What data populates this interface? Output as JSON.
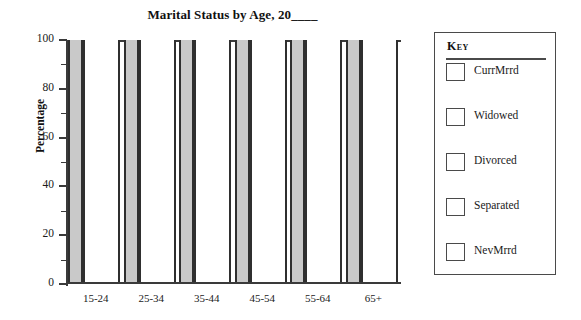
{
  "chart_data": {
    "type": "bar",
    "title": "Marital Status by Age, 20____",
    "xlabel": "",
    "ylabel": "Percentage",
    "categories": [
      "15-24",
      "25-34",
      "35-44",
      "45-54",
      "55-64",
      "65+"
    ],
    "series": [
      {
        "name": "CurrMrrd",
        "values": [
          100,
          100,
          100,
          100,
          100,
          100
        ]
      },
      {
        "name": "Widowed",
        "values": [
          0,
          0,
          0,
          0,
          0,
          0
        ]
      },
      {
        "name": "Divorced",
        "values": [
          0,
          0,
          0,
          0,
          0,
          0
        ]
      },
      {
        "name": "Separated",
        "values": [
          0,
          0,
          0,
          0,
          0,
          0
        ]
      },
      {
        "name": "NevMrrd",
        "values": [
          0,
          0,
          0,
          0,
          0,
          0
        ]
      }
    ],
    "stacked": true,
    "ylim": [
      0,
      100
    ],
    "y_ticks": [
      0,
      20,
      40,
      60,
      80,
      100
    ],
    "y_tick_labels": [
      "0",
      "20",
      "40",
      "60",
      "80",
      "100"
    ],
    "y_minor_ticks": [
      10,
      30,
      50,
      70,
      90
    ],
    "grid": false,
    "legend_position": "right",
    "bar_fill_gray": "#c9c9c9",
    "bar_fill_white": "#ffffff",
    "bar_outline": "#2f2f2f",
    "axis_color": "#3a3a3a"
  },
  "title": {
    "text": "Marital Status by Age, 20____"
  },
  "axes": {
    "y_title": "Percentage",
    "y_tick_labels": [
      "100",
      "80",
      "60",
      "40",
      "20",
      "0"
    ],
    "x_tick_labels": [
      "15-24",
      "25-34",
      "35-44",
      "45-54",
      "55-64",
      "65+"
    ]
  },
  "legend": {
    "title": "Key",
    "items": [
      {
        "label": "CurrMrrd"
      },
      {
        "label": "Widowed"
      },
      {
        "label": "Divorced"
      },
      {
        "label": "Separated"
      },
      {
        "label": "NevMrrd"
      }
    ]
  }
}
